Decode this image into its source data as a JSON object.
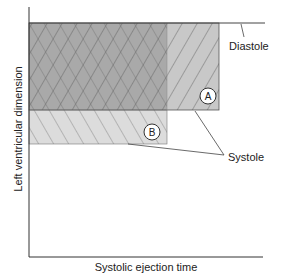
{
  "diagram": {
    "y_axis_label": "Left ventricular dimension",
    "x_axis_label": "Systolic ejection time",
    "labels": {
      "diastole": "Diastole",
      "systole": "Systole",
      "region_a": "A",
      "region_b": "B"
    },
    "colors": {
      "overlap_fill": "#a9a9a9",
      "region_a_fill": "#c8c8c8",
      "region_b_fill": "#dcdcdc",
      "hatch_line": "#555555",
      "axis_line": "#333333"
    }
  }
}
